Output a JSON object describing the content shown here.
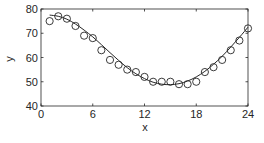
{
  "chart_data": {
    "type": "scatter",
    "title": "",
    "xlabel": "x",
    "ylabel": "y",
    "xlim": [
      0,
      24
    ],
    "ylim": [
      40,
      80
    ],
    "xticks": [
      0,
      6,
      12,
      18,
      24
    ],
    "yticks": [
      40,
      50,
      60,
      70,
      80
    ],
    "grid": false,
    "legend": null,
    "series": [
      {
        "name": "data",
        "style": "open-circle-markers",
        "x": [
          1,
          2,
          3,
          4,
          5,
          6,
          7,
          8,
          9,
          10,
          11,
          12,
          13,
          14,
          15,
          16,
          17,
          18,
          19,
          20,
          21,
          22,
          23,
          24
        ],
        "y": [
          75,
          77,
          76,
          73,
          69,
          68,
          63,
          59,
          57,
          55,
          54,
          52,
          50,
          50,
          50,
          49,
          49,
          50,
          54,
          56,
          59,
          63,
          67,
          72
        ]
      },
      {
        "name": "fit",
        "style": "solid-line",
        "x": [
          1,
          2,
          3,
          4,
          5,
          6,
          7,
          8,
          9,
          10,
          11,
          12,
          13,
          14,
          15,
          16,
          17,
          18,
          19,
          20,
          21,
          22,
          23,
          24
        ],
        "y": [
          77.5,
          77,
          75.8,
          73.8,
          71.3,
          68.5,
          65.3,
          62,
          58.8,
          55.8,
          53.3,
          51.3,
          49.8,
          49,
          48.8,
          49.2,
          50.3,
          52,
          54.3,
          57.2,
          60.5,
          64.3,
          68.3,
          72.5
        ]
      }
    ]
  },
  "colors": {
    "axis": "#262626",
    "marker": "#262626",
    "line": "#262626",
    "background": "#ffffff"
  }
}
